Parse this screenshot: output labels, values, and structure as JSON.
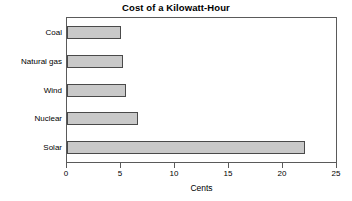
{
  "chart_data": {
    "type": "bar",
    "orientation": "horizontal",
    "title": "Cost of a Kilowatt-Hour",
    "xlabel": "Cents",
    "ylabel": "",
    "categories": [
      "Coal",
      "Natural gas",
      "Wind",
      "Nuclear",
      "Solar"
    ],
    "values": [
      5.0,
      5.2,
      5.5,
      6.6,
      22.0
    ],
    "xlim": [
      0,
      25
    ],
    "xticks": [
      0,
      5,
      10,
      15,
      20,
      25
    ],
    "xtick_labels": [
      "0",
      "5",
      "10",
      "15",
      "20",
      "25"
    ],
    "grid": false,
    "legend": null,
    "series": [
      {
        "name": "Cost",
        "values": [
          5.0,
          5.2,
          5.5,
          6.6,
          22.0
        ]
      }
    ],
    "colors": {
      "bar_fill": "#c9c9c9",
      "bar_border": "#4a4a4a",
      "axis": "#5a5a5a",
      "text": "#000000",
      "background": "#ffffff"
    }
  }
}
